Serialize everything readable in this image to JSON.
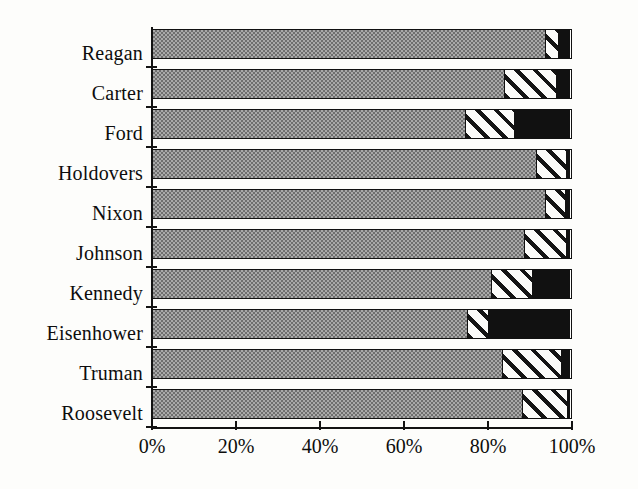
{
  "chart_data": {
    "type": "bar",
    "orientation": "horizontal",
    "stacked": true,
    "normalized": true,
    "title": "",
    "subtitle": "",
    "xlabel": "",
    "ylabel": "",
    "xlim": [
      0,
      100
    ],
    "grid": false,
    "legend": "none",
    "x_ticks": [
      "0%",
      "20%",
      "40%",
      "60%",
      "80%",
      "100%"
    ],
    "x_tick_values": [
      0,
      20,
      40,
      60,
      80,
      100
    ],
    "categories": [
      "Reagan",
      "Carter",
      "Ford",
      "Holdovers",
      "Nixon",
      "Johnson",
      "Kennedy",
      "Eisenhower",
      "Truman",
      "Roosevelt"
    ],
    "series": [
      {
        "name": "segment-1",
        "pattern": "stippled-gray",
        "color": "#a9a9a9",
        "values": [
          93.8,
          84.0,
          74.8,
          91.7,
          94.0,
          88.8,
          81.0,
          75.2,
          83.6,
          88.3
        ]
      },
      {
        "name": "segment-2",
        "pattern": "diagonal-hatch",
        "color": "#ffffff",
        "values": [
          3.3,
          12.6,
          11.9,
          7.4,
          4.8,
          10.2,
          9.8,
          5.2,
          14.3,
          11.0
        ]
      },
      {
        "name": "segment-3",
        "pattern": "solid-black",
        "color": "#111111",
        "values": [
          2.9,
          3.4,
          13.3,
          0.9,
          1.2,
          1.0,
          9.2,
          19.6,
          2.1,
          0.7
        ]
      }
    ]
  }
}
